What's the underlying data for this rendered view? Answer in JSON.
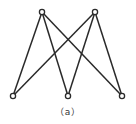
{
  "diagram": {
    "type": "bipartite-graph",
    "caption": "（a）",
    "colors": {
      "stroke": "#2a2a2a",
      "background": "#ffffff"
    },
    "vertices": [
      {
        "id": "t1",
        "x": 42,
        "y": 12
      },
      {
        "id": "t2",
        "x": 95,
        "y": 12
      },
      {
        "id": "b1",
        "x": 13,
        "y": 96
      },
      {
        "id": "b2",
        "x": 68,
        "y": 96
      },
      {
        "id": "b3",
        "x": 122,
        "y": 96
      }
    ],
    "edges": [
      [
        "t1",
        "b1"
      ],
      [
        "t1",
        "b2"
      ],
      [
        "t1",
        "b3"
      ],
      [
        "t2",
        "b1"
      ],
      [
        "t2",
        "b2"
      ],
      [
        "t2",
        "b3"
      ]
    ]
  }
}
